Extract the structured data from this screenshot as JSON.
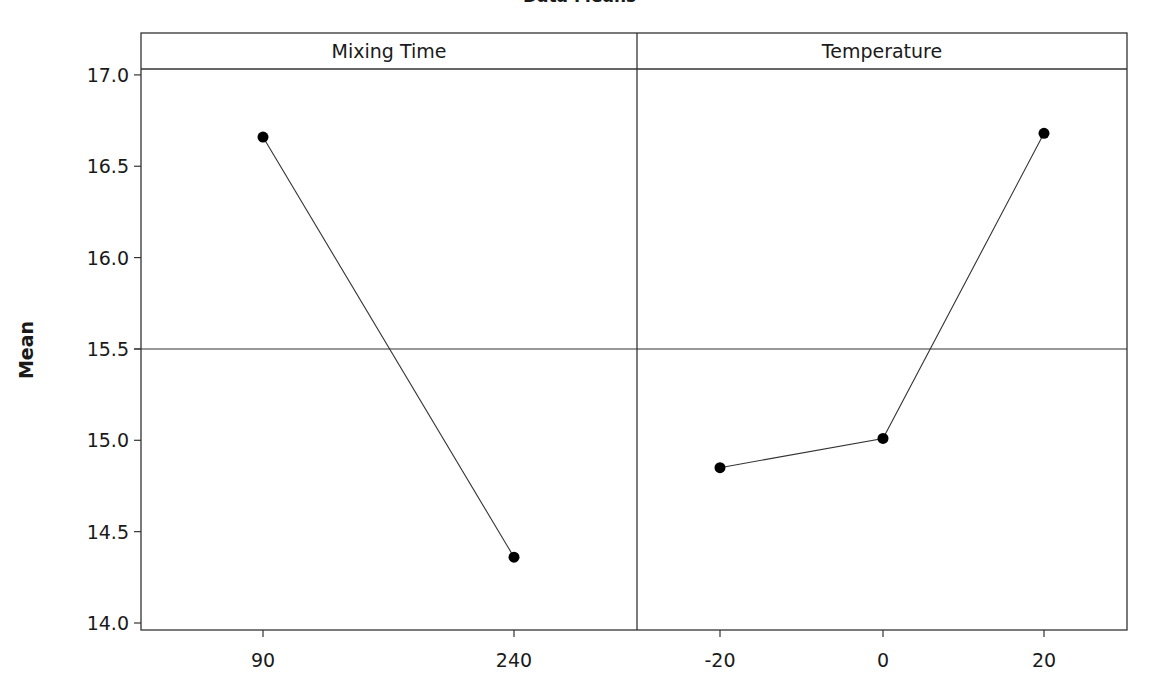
{
  "chart_data": {
    "type": "line",
    "title": "Data Means",
    "ylabel": "Mean",
    "xlabel": "",
    "ylim": [
      13.95,
      17.25
    ],
    "yticks": [
      14.0,
      14.5,
      15.0,
      15.5,
      16.0,
      16.5,
      17.0
    ],
    "ytick_labels": [
      "14.0",
      "14.5",
      "15.0",
      "15.5",
      "16.0",
      "16.5",
      "17.0"
    ],
    "reference_line": 15.5,
    "grid": false,
    "legend": null,
    "panels": [
      {
        "name": "Mixing Time",
        "categories": [
          "90",
          "240"
        ],
        "values": [
          16.66,
          14.36
        ]
      },
      {
        "name": "Temperature",
        "categories": [
          "-20",
          "0",
          "20"
        ],
        "values": [
          14.85,
          15.01,
          16.68
        ]
      }
    ]
  },
  "colors": {
    "line": "#333333",
    "marker": "#000000",
    "frame": "#333333",
    "background": "#ffffff"
  }
}
